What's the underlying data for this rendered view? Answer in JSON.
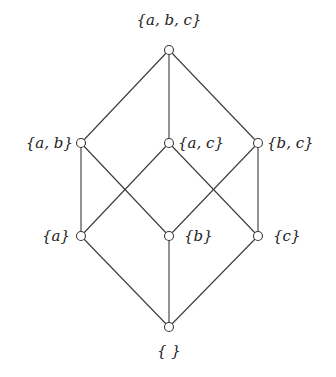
{
  "diagram": {
    "type": "hasse-diagram",
    "nodes": [
      {
        "id": "abc",
        "label": "{a, b, c}",
        "x": 169,
        "y": 50,
        "label_x": 169,
        "label_y": 25,
        "anchor": "middle"
      },
      {
        "id": "ab",
        "label": "{a, b}",
        "x": 81,
        "y": 143,
        "label_x": 73,
        "label_y": 148,
        "anchor": "end"
      },
      {
        "id": "ac",
        "label": "{a, c}",
        "x": 169,
        "y": 143,
        "label_x": 178,
        "label_y": 148,
        "anchor": "start"
      },
      {
        "id": "bc",
        "label": "{b, c}",
        "x": 258,
        "y": 143,
        "label_x": 267,
        "label_y": 148,
        "anchor": "start"
      },
      {
        "id": "a",
        "label": "{a}",
        "x": 81,
        "y": 236,
        "label_x": 70,
        "label_y": 241,
        "anchor": "end"
      },
      {
        "id": "b",
        "label": "{b}",
        "x": 169,
        "y": 236,
        "label_x": 184,
        "label_y": 241,
        "anchor": "start"
      },
      {
        "id": "c",
        "label": "{c}",
        "x": 258,
        "y": 236,
        "label_x": 273,
        "label_y": 241,
        "anchor": "start"
      },
      {
        "id": "empty",
        "label": "{ }",
        "x": 169,
        "y": 327,
        "label_x": 169,
        "label_y": 356,
        "anchor": "middle"
      }
    ],
    "edges": [
      [
        "abc",
        "ab"
      ],
      [
        "abc",
        "ac"
      ],
      [
        "abc",
        "bc"
      ],
      [
        "ab",
        "a"
      ],
      [
        "ab",
        "b"
      ],
      [
        "ac",
        "a"
      ],
      [
        "ac",
        "c"
      ],
      [
        "bc",
        "b"
      ],
      [
        "bc",
        "c"
      ],
      [
        "a",
        "empty"
      ],
      [
        "b",
        "empty"
      ],
      [
        "c",
        "empty"
      ]
    ]
  }
}
